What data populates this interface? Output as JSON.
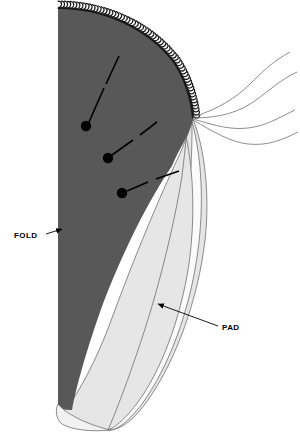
{
  "figure": {
    "type": "sewing-pattern-diagram",
    "canvas": {
      "width": 300,
      "height": 434
    },
    "colors": {
      "background": "#ffffff",
      "fabric_dark": "#585858",
      "pad_light": "#e6e6e6",
      "pad_white": "#fbfbfb",
      "outline": "#6f6f6f",
      "ink": "#000000",
      "stitch": "#1a1a1a"
    }
  },
  "labels": [
    {
      "id": "fold",
      "text": "FOLD",
      "text_x": 14,
      "text_y": 238,
      "leader": "M46,234 L62,229",
      "arrow_at": [
        62,
        229
      ],
      "arrow_dir": "right"
    },
    {
      "id": "pad",
      "text": "PAD",
      "text_x": 222,
      "text_y": 330,
      "leader": "M218,326 L158,304",
      "arrow_at": [
        158,
        304
      ],
      "arrow_dir": "upleft"
    }
  ],
  "pins": [
    {
      "id": "pin-1",
      "cx": 86,
      "cy": 126,
      "r": 5.2,
      "shaft": "M89,122 L104,88",
      "head": "M106,84 L119,56"
    },
    {
      "id": "pin-2",
      "cx": 108,
      "cy": 158,
      "r": 5.2,
      "shaft": "M112,155 L133,140",
      "head": "M140,135 L157,122"
    },
    {
      "id": "pin-3",
      "cx": 122,
      "cy": 193,
      "r": 5.2,
      "shaft": "M127,191 L148,182",
      "head": "M156,179 L179,171"
    }
  ],
  "threads": [
    {
      "id": "thread-1",
      "d": "M193,117 C218,109 236,98 250,84 C262,72 272,62 290,52"
    },
    {
      "id": "thread-2",
      "d": "M193,118 C220,118 240,112 256,100 C270,90 280,80 297,72"
    },
    {
      "id": "thread-3",
      "d": "M193,119 C216,126 232,130 248,128 C266,126 278,118 295,110"
    },
    {
      "id": "thread-4",
      "d": "M193,120 C214,132 230,142 248,144 C268,146 282,140 298,132"
    }
  ],
  "shapes": {
    "fabric_dark": "M58,8 C104,8 148,28 174,62 C190,83 196,110 193,119 C189,137 178,150 172,166 C150,198 122,252 100,312 C86,352 76,388 72,410 C66,410 60,409 58,408 Z",
    "pad_outer": "M193,119 C205,150 210,195 205,240 C198,300 176,360 148,400 C134,420 122,428 112,430 C96,430 76,424 62,414 C76,398 96,362 112,318 C134,258 160,196 178,158 C186,140 190,128 193,119 Z",
    "pad_band_a": "M192,122 C202,158 204,205 198,250 C190,312 168,368 142,404 C128,422 118,429 110,430 C118,418 132,392 146,358 C168,302 184,236 190,180 C192,156 192,136 192,122 Z",
    "pad_band_b": "M186,136 C194,174 195,220 189,264 C180,322 160,372 138,402 C126,418 116,427 108,430 C114,416 126,386 138,350 C158,292 174,226 182,176 C184,158 186,144 186,136 Z",
    "hem_bottom": "M58,404 C66,414 86,424 110,430 C92,432 72,430 62,424 C56,419 55,410 58,404 Z"
  },
  "serged_edge": {
    "id": "serger-stitch",
    "path": "M58,8 C104,8 148,28 174,62 C186,80 192,103 193,118",
    "loop_count": 64,
    "description": "overlock / serger stitching along curved outer edge"
  },
  "dimensions": {
    "width": 300,
    "height": 434
  }
}
